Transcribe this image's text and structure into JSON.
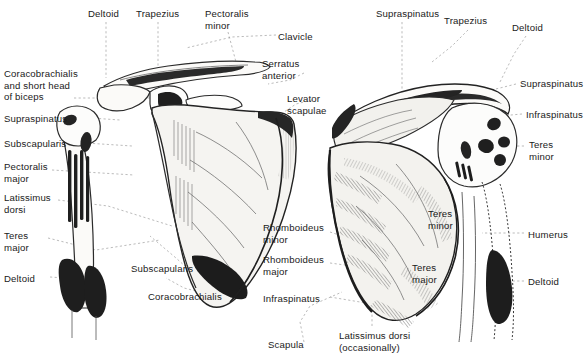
{
  "figure": {
    "background_color": "#ffffff",
    "text_color": "#1a1a1a",
    "leader_line_color": "#9a9a9a",
    "ink_color": "#222222",
    "bone_fill_color": "#f4f3f0",
    "shaded_fill_color": "#e8e7e2"
  },
  "views": [
    {
      "id": "anterior",
      "name": "anterior-scapula-view"
    },
    {
      "id": "posterior",
      "name": "posterior-scapula-view"
    }
  ],
  "labels": [
    {
      "id": "l01",
      "text": "Deltoid",
      "x": 88,
      "y": 8,
      "align": "left",
      "view": "anterior"
    },
    {
      "id": "l02",
      "text": "Trapezius",
      "x": 136,
      "y": 8,
      "align": "left",
      "view": "anterior"
    },
    {
      "id": "l03",
      "text": "Pectoralis\nminor",
      "x": 205,
      "y": 8,
      "align": "left",
      "view": "anterior"
    },
    {
      "id": "l04",
      "text": "Clavicle",
      "x": 278,
      "y": 31,
      "align": "left",
      "view": "anterior"
    },
    {
      "id": "l05",
      "text": "Serratus\nanterior",
      "x": 262,
      "y": 58,
      "align": "left",
      "view": "anterior"
    },
    {
      "id": "l06",
      "text": "Levator\nscapulae",
      "x": 287,
      "y": 93,
      "align": "left",
      "view": "anterior"
    },
    {
      "id": "l07",
      "text": "Coracobrachialis\nand short head\nof biceps",
      "x": 4,
      "y": 68,
      "align": "left",
      "view": "anterior"
    },
    {
      "id": "l08",
      "text": "Supraspinatus",
      "x": 4,
      "y": 113,
      "align": "left",
      "view": "anterior"
    },
    {
      "id": "l09",
      "text": "Subscapularis",
      "x": 4,
      "y": 138,
      "align": "left",
      "view": "anterior"
    },
    {
      "id": "l10",
      "text": "Pectoralis\nmajor",
      "x": 4,
      "y": 161,
      "align": "left",
      "view": "anterior"
    },
    {
      "id": "l11",
      "text": "Latissimus\ndorsi",
      "x": 4,
      "y": 192,
      "align": "left",
      "view": "anterior"
    },
    {
      "id": "l12",
      "text": "Teres\nmajor",
      "x": 4,
      "y": 230,
      "align": "left",
      "view": "anterior"
    },
    {
      "id": "l13",
      "text": "Deltoid",
      "x": 4,
      "y": 273,
      "align": "left",
      "view": "anterior"
    },
    {
      "id": "l14",
      "text": "Subscapularis",
      "x": 131,
      "y": 263,
      "align": "left",
      "view": "anterior"
    },
    {
      "id": "l15",
      "text": "Coracobrachialis",
      "x": 148,
      "y": 291,
      "align": "left",
      "view": "anterior"
    },
    {
      "id": "l16",
      "text": "Supraspinatus",
      "x": 376,
      "y": 8,
      "align": "left",
      "view": "posterior"
    },
    {
      "id": "l17",
      "text": "Trapezius",
      "x": 444,
      "y": 15,
      "align": "left",
      "view": "posterior"
    },
    {
      "id": "l18",
      "text": "Deltoid",
      "x": 512,
      "y": 22,
      "align": "left",
      "view": "posterior"
    },
    {
      "id": "l19",
      "text": "Supraspinatus",
      "x": 520,
      "y": 78,
      "align": "left",
      "view": "posterior"
    },
    {
      "id": "l20",
      "text": "Infraspinatus",
      "x": 526,
      "y": 109,
      "align": "left",
      "view": "posterior"
    },
    {
      "id": "l21",
      "text": "Teres\nminor",
      "x": 529,
      "y": 139,
      "align": "left",
      "view": "posterior"
    },
    {
      "id": "l22",
      "text": "Humerus",
      "x": 528,
      "y": 229,
      "align": "left",
      "view": "posterior"
    },
    {
      "id": "l23",
      "text": "Deltoid",
      "x": 528,
      "y": 276,
      "align": "left",
      "view": "posterior"
    },
    {
      "id": "l24",
      "text": "Teres\nminor",
      "x": 428,
      "y": 208,
      "align": "left",
      "view": "posterior"
    },
    {
      "id": "l25",
      "text": "Teres\nmajor",
      "x": 412,
      "y": 262,
      "align": "left",
      "view": "posterior"
    },
    {
      "id": "l26",
      "text": "Rhomboideus\nminor",
      "x": 263,
      "y": 222,
      "align": "left",
      "view": "posterior"
    },
    {
      "id": "l27",
      "text": "Rhomboideus\nmajor",
      "x": 263,
      "y": 254,
      "align": "left",
      "view": "posterior"
    },
    {
      "id": "l28",
      "text": "Infraspinatus",
      "x": 263,
      "y": 293,
      "align": "left",
      "view": "posterior"
    },
    {
      "id": "l29",
      "text": "Scapula",
      "x": 268,
      "y": 339,
      "align": "left",
      "view": "posterior"
    },
    {
      "id": "l30",
      "text": "Latissimus dorsi\n(occasionally)",
      "x": 339,
      "y": 330,
      "align": "left",
      "view": "posterior"
    }
  ]
}
